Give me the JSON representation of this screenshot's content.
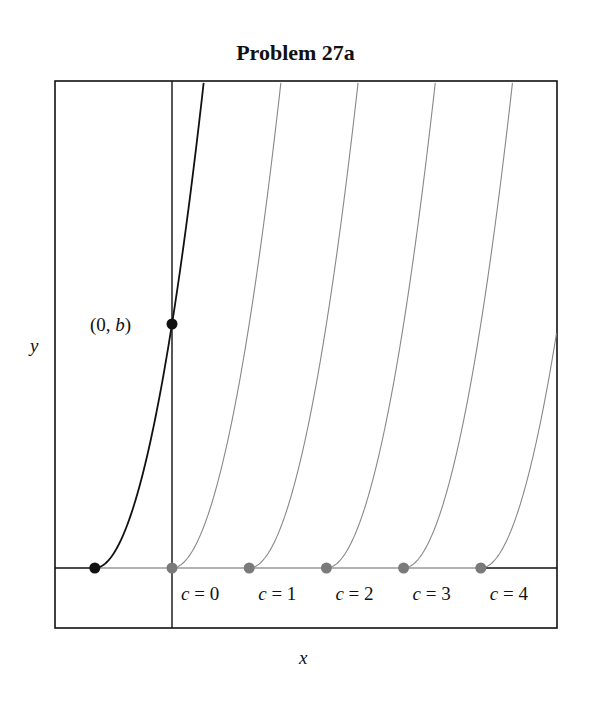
{
  "chart_data": {
    "type": "line",
    "title": "Problem 27a",
    "xlabel": "x",
    "ylabel": "y",
    "grid": false,
    "legend": null,
    "function_family": "y = (x - c)^2 for x >= c, y = 0 for x < c",
    "xlim": [
      -1.52,
      4.99
    ],
    "ylim": [
      -0.25,
      2.0
    ],
    "highlighted_point": {
      "label": "(0, b)",
      "x": 0,
      "y": 1
    },
    "series": [
      {
        "name": "highlighted solution (through (0,b))",
        "c": -1,
        "color": "#111111",
        "start_point": [
          -1,
          0
        ]
      },
      {
        "name": "c = 0",
        "c": 0,
        "color": "#888888",
        "start_point": [
          0,
          0
        ]
      },
      {
        "name": "c = 1",
        "c": 1,
        "color": "#888888",
        "start_point": [
          1,
          0
        ]
      },
      {
        "name": "c = 2",
        "c": 2,
        "color": "#888888",
        "start_point": [
          2,
          0
        ]
      },
      {
        "name": "c = 3",
        "c": 3,
        "color": "#888888",
        "start_point": [
          3,
          0
        ]
      },
      {
        "name": "c = 4",
        "c": 4,
        "color": "#888888",
        "start_point": [
          4,
          0
        ]
      }
    ],
    "annotations": [
      "(0, b)",
      "c = 0",
      "c = 1",
      "c = 2",
      "c = 3",
      "c = 4"
    ]
  },
  "title": "Problem 27a",
  "axes": {
    "x_label": "x",
    "y_label": "y"
  },
  "point_label": {
    "pre": "(0, ",
    "var": "b",
    "post": ")"
  },
  "c_labels": [
    {
      "var": "c",
      "eq": " = 0"
    },
    {
      "var": "c",
      "eq": " = 1"
    },
    {
      "var": "c",
      "eq": " = 2"
    },
    {
      "var": "c",
      "eq": " = 3"
    },
    {
      "var": "c",
      "eq": " = 4"
    }
  ],
  "colors": {
    "highlight": "#111111",
    "family": "#888888",
    "axis": "#111111",
    "dot_gray": "#7a7a7a"
  }
}
